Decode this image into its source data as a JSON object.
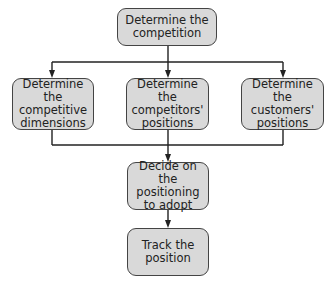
{
  "diagram": {
    "type": "flowchart",
    "nodes": [
      {
        "id": "competition",
        "label": "Determine the competition"
      },
      {
        "id": "dimensions",
        "label": "Determine the competitive dimensions"
      },
      {
        "id": "competitors",
        "label": "Determine the competitors' positions"
      },
      {
        "id": "customers",
        "label": "Determine the customers' positions"
      },
      {
        "id": "decide",
        "label": "Decide on the positioning to adopt"
      },
      {
        "id": "track",
        "label": "Track the position"
      }
    ],
    "edges": [
      {
        "from": "competition",
        "to": "dimensions"
      },
      {
        "from": "competition",
        "to": "competitors"
      },
      {
        "from": "competition",
        "to": "customers"
      },
      {
        "from": "dimensions",
        "to": "decide"
      },
      {
        "from": "competitors",
        "to": "decide"
      },
      {
        "from": "customers",
        "to": "decide"
      },
      {
        "from": "decide",
        "to": "track"
      }
    ]
  },
  "colors": {
    "box_fill": "#d9d9d9",
    "box_border": "#444444",
    "line": "#222222",
    "text": "#222222"
  }
}
